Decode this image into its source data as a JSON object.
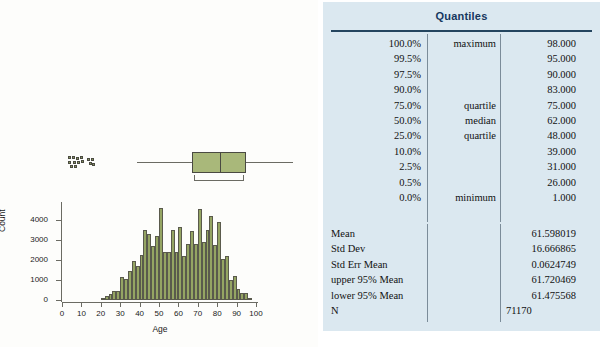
{
  "report": {
    "title": "Quantiles",
    "quantiles": [
      {
        "percent": "100.0%",
        "label": "maximum",
        "value": "98.000"
      },
      {
        "percent": "99.5%",
        "label": "",
        "value": "95.000"
      },
      {
        "percent": "97.5%",
        "label": "",
        "value": "90.000"
      },
      {
        "percent": "90.0%",
        "label": "",
        "value": "83.000"
      },
      {
        "percent": "75.0%",
        "label": "quartile",
        "value": "75.000"
      },
      {
        "percent": "50.0%",
        "label": "median",
        "value": "62.000"
      },
      {
        "percent": "25.0%",
        "label": "quartile",
        "value": "48.000"
      },
      {
        "percent": "10.0%",
        "label": "",
        "value": "39.000"
      },
      {
        "percent": "2.5%",
        "label": "",
        "value": "31.000"
      },
      {
        "percent": "0.5%",
        "label": "",
        "value": "26.000"
      },
      {
        "percent": "0.0%",
        "label": "minimum",
        "value": "1.000"
      }
    ],
    "summary": [
      {
        "label": "Mean",
        "value": "61.598019",
        "align": "right"
      },
      {
        "label": "Std Dev",
        "value": "16.666865",
        "align": "right"
      },
      {
        "label": "Std Err Mean",
        "value": "0.0624749",
        "align": "right"
      },
      {
        "label": "upper 95% Mean",
        "value": "61.720469",
        "align": "right"
      },
      {
        "label": "lower 95% Mean",
        "value": "61.475568",
        "align": "right"
      },
      {
        "label": "N",
        "value": "71170",
        "align": "left"
      }
    ]
  },
  "colors": {
    "panel_background": "#dbe8f0",
    "title_text": "#16375e",
    "bar_fill": "#95a563",
    "bar_outline": "#5a5a4c",
    "axis": "#6b6b63"
  },
  "boxplot": {
    "min_whisker": 21,
    "q1": 48,
    "median": 62,
    "q3": 75,
    "max_whisker": 98,
    "outliers_low_label": "low-outlier-cluster"
  },
  "chart_data": {
    "type": "bar",
    "title": "",
    "xlabel": "Age",
    "ylabel": "Count",
    "xlim": [
      0,
      100
    ],
    "ylim": [
      0,
      4800
    ],
    "xticks": [
      0,
      10,
      20,
      30,
      40,
      50,
      60,
      70,
      80,
      90,
      100
    ],
    "yticks": [
      0,
      1000,
      2000,
      3000,
      4000
    ],
    "grid": false,
    "legend": "none",
    "bin_width": 2,
    "x": [
      21,
      23,
      25,
      27,
      29,
      31,
      33,
      35,
      37,
      39,
      41,
      43,
      45,
      47,
      49,
      51,
      53,
      55,
      57,
      59,
      61,
      63,
      65,
      67,
      69,
      71,
      73,
      75,
      77,
      79,
      81,
      83,
      85,
      87,
      89,
      91,
      93,
      95,
      97
    ],
    "categories": [
      "20-22",
      "22-24",
      "24-26",
      "26-28",
      "28-30",
      "30-32",
      "32-34",
      "34-36",
      "36-38",
      "38-40",
      "40-42",
      "42-44",
      "44-46",
      "46-48",
      "48-50",
      "50-52",
      "52-54",
      "54-56",
      "56-58",
      "58-60",
      "60-62",
      "62-64",
      "64-66",
      "66-68",
      "68-70",
      "70-72",
      "72-74",
      "74-76",
      "76-78",
      "78-80",
      "80-82",
      "82-84",
      "84-86",
      "86-88",
      "88-90",
      "90-92",
      "92-94",
      "94-96",
      "96-98"
    ],
    "values": [
      90,
      180,
      300,
      430,
      470,
      1160,
      1060,
      1430,
      1960,
      1700,
      2230,
      3500,
      3300,
      2720,
      3200,
      4580,
      2400,
      2420,
      3480,
      2380,
      3640,
      2220,
      2780,
      3460,
      2820,
      4540,
      2900,
      3500,
      4220,
      2740,
      3900,
      2060,
      2180,
      1020,
      1220,
      560,
      350,
      330,
      60
    ]
  }
}
